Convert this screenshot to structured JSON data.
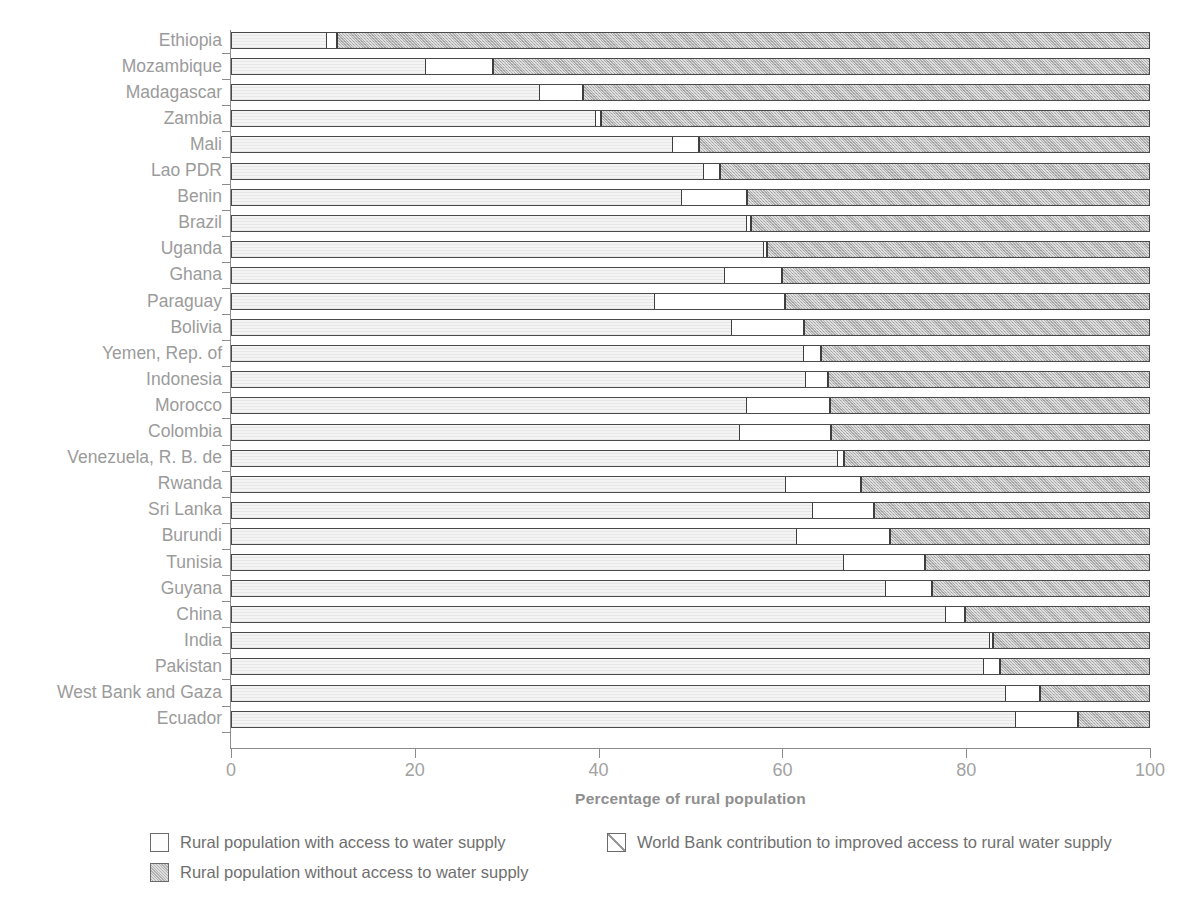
{
  "chart_data": {
    "type": "bar",
    "orientation": "horizontal",
    "stacked": true,
    "title": "",
    "subtitle": "",
    "xlabel": "Percentage of rural population",
    "ylabel": "",
    "xlim": [
      0,
      100
    ],
    "xticks": [
      "0",
      "20",
      "40",
      "60",
      "80",
      "100"
    ],
    "grid": false,
    "legend_position": "bottom",
    "categories": [
      "Ethiopia",
      "Mozambique",
      "Madagascar",
      "Zambia",
      "Mali",
      "Lao PDR",
      "Benin",
      "Brazil",
      "Uganda",
      "Ghana",
      "Paraguay",
      "Bolivia",
      "Yemen, Rep. of",
      "Indonesia",
      "Morocco",
      "Colombia",
      "Venezuela, R. B. de",
      "Rwanda",
      "Sri Lanka",
      "Burundi",
      "Tunisia",
      "Guyana",
      "China",
      "India",
      "Pakistan",
      "West Bank and Gaza",
      "Ecuador"
    ],
    "series": [
      {
        "name": "Rural population with access to water supply",
        "key": "access",
        "values": [
          10.2,
          21.1,
          33.5,
          39.6,
          48.0,
          51.4,
          49.0,
          56.0,
          57.9,
          53.6,
          46.0,
          54.4,
          62.3,
          62.5,
          56.0,
          55.3,
          66.0,
          60.3,
          63.3,
          61.5,
          66.6,
          71.2,
          77.8,
          82.5,
          81.9,
          84.3,
          85.4
        ]
      },
      {
        "name": "World Bank contribution to improved access to rural water supply",
        "key": "world_bank",
        "values": [
          1.2,
          7.4,
          4.8,
          0.6,
          2.9,
          1.8,
          7.2,
          0.6,
          0.4,
          6.4,
          14.3,
          8.0,
          1.9,
          2.5,
          9.2,
          10.0,
          0.7,
          8.3,
          6.7,
          10.3,
          9.0,
          5.1,
          2.1,
          0.5,
          1.9,
          3.8,
          6.9
        ]
      },
      {
        "name": "Rural population without access to water supply",
        "key": "no_access",
        "values": [
          88.6,
          71.5,
          61.7,
          59.8,
          49.1,
          46.8,
          43.8,
          43.4,
          41.7,
          40.0,
          39.7,
          37.6,
          35.8,
          35.0,
          34.8,
          34.7,
          33.3,
          31.4,
          30.0,
          28.2,
          24.4,
          23.7,
          20.1,
          17.0,
          16.2,
          11.9,
          7.7
        ]
      }
    ]
  },
  "axis": {
    "x_title": "Percentage of rural population",
    "x_tick_labels": [
      "0",
      "20",
      "40",
      "60",
      "80",
      "100"
    ],
    "y_tick_labels": [
      "Ethiopia",
      "Mozambique",
      "Madagascar",
      "Zambia",
      "Mali",
      "Lao PDR",
      "Benin",
      "Brazil",
      "Uganda",
      "Ghana",
      "Paraguay",
      "Bolivia",
      "Yemen, Rep. of",
      "Indonesia",
      "Morocco",
      "Colombia",
      "Venezuela, R. B. de",
      "Rwanda",
      "Sri Lanka",
      "Burundi",
      "Tunisia",
      "Guyana",
      "China",
      "India",
      "Pakistan",
      "West Bank and Gaza",
      "Ecuador"
    ]
  },
  "legend": {
    "items": [
      {
        "label": "Rural population with access to water supply",
        "swatch": "access-swatch",
        "color": "#f4f4f4"
      },
      {
        "label": "World Bank contribution to improved access to rural water supply",
        "swatch": "world-bank-swatch",
        "color": "#ffffff"
      },
      {
        "label": "Rural population without access to water supply",
        "swatch": "no-access-swatch",
        "color": "#bcbcbc"
      }
    ]
  },
  "colors": {
    "access": "#f4f4f4",
    "world_bank": "#ffffff",
    "no_access": "#bcbcbc",
    "axis": "#8c8c8c",
    "label_text": "#9b9b9b",
    "legend_text": "#6f6f6f"
  }
}
